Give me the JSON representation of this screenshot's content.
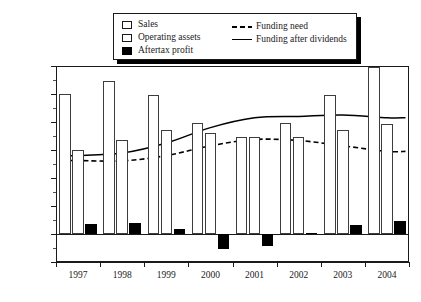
{
  "chart_data": {
    "type": "bar",
    "title": "",
    "subtitle": "",
    "xlabel": "",
    "ylabel": "",
    "grid": false,
    "legend_position": "top-center",
    "categories": [
      "1997",
      "1998",
      "1999",
      "2000",
      "2001",
      "2002",
      "2003",
      "2004"
    ],
    "ylim": [
      -200,
      1200
    ],
    "ytick_values": [
      -200,
      0,
      200,
      400,
      600,
      800,
      1000,
      1200
    ],
    "ytick_labels": [
      "-200",
      "0",
      "200",
      "400",
      "600",
      "800",
      "1,000",
      "1,200"
    ],
    "series": [
      {
        "name": "Sales",
        "kind": "bar",
        "style": "open-bar",
        "color": "#ffffff",
        "edge_color": "#3d3d3d",
        "values": [
          1000,
          1090,
          995,
          790,
          690,
          790,
          990,
          1190
        ]
      },
      {
        "name": "Operating assets",
        "kind": "bar",
        "style": "open-bar",
        "color": "#ffffff",
        "edge_color": "#3d3d3d",
        "values": [
          600,
          670,
          745,
          720,
          690,
          690,
          740,
          785
        ]
      },
      {
        "name": "Aftertax profit",
        "kind": "bar",
        "style": "filled-bar",
        "color": "#000000",
        "edge_color": "#000000",
        "values": [
          70,
          80,
          35,
          -110,
          -85,
          5,
          65,
          90
        ]
      },
      {
        "name": "Funding need",
        "kind": "line",
        "style": "dashed",
        "color": "#000000",
        "values": [
          525,
          522,
          560,
          630,
          675,
          668,
          630,
          590
        ]
      },
      {
        "name": "Funding after dividends",
        "kind": "line",
        "style": "solid",
        "color": "#000000",
        "values": [
          560,
          578,
          650,
          760,
          830,
          840,
          850,
          830
        ]
      }
    ]
  },
  "legend": {
    "entries": [
      {
        "label": "Sales",
        "marker": "open-square"
      },
      {
        "label": "Operating assets",
        "marker": "open-square"
      },
      {
        "label": "Aftertax profit",
        "marker": "filled-square"
      },
      {
        "label": "Funding need",
        "marker": "dashed-line"
      },
      {
        "label": "Funding after dividends",
        "marker": "solid-line"
      }
    ]
  }
}
